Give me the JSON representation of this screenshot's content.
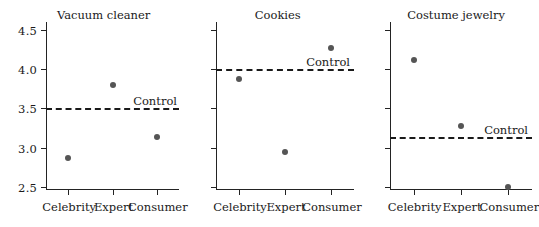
{
  "chart_data": {
    "type": "scatter",
    "title": "",
    "categories": [
      "Celebrity",
      "Expert",
      "Consumer"
    ],
    "xlabel": "",
    "ylabel": "",
    "ylim": [
      2.5,
      4.5
    ],
    "yticks": [
      "2.5",
      "3.0",
      "3.5",
      "4.0",
      "4.5"
    ],
    "ytick_values": [
      2.5,
      3.0,
      3.5,
      4.0,
      4.5
    ],
    "grid": false,
    "legend": "none",
    "annotation_label": "Control",
    "panels": [
      {
        "title": "Vacuum cleaner",
        "show_y_labels": true,
        "control": 3.5,
        "values": [
          2.87,
          3.8,
          3.13
        ]
      },
      {
        "title": "Cookies",
        "show_y_labels": false,
        "control": 4.0,
        "values": [
          3.88,
          2.95,
          4.27
        ]
      },
      {
        "title": "Costume jewelry",
        "show_y_labels": false,
        "control": 3.13,
        "values": [
          4.12,
          3.27,
          2.5
        ]
      }
    ],
    "colors": {
      "marker": "#555555",
      "axis": "#232323",
      "control_line": "#1a1a1a",
      "background": "#ffffff"
    }
  }
}
